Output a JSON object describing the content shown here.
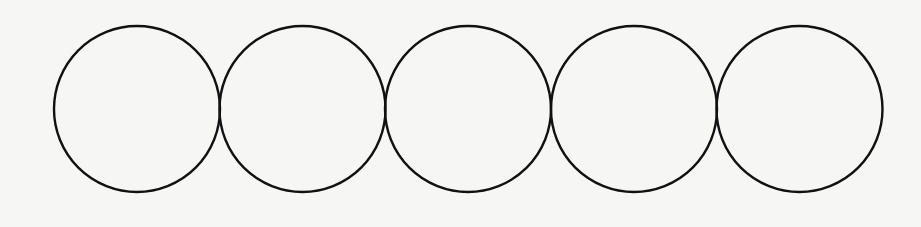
{
  "diagram": {
    "title": "Five tangent circles in a row",
    "background": "#f6f6f5",
    "stroke": "#111111",
    "stroke_width": 2.4,
    "circles": [
      {
        "cx": 137,
        "cy": 109,
        "r": 83
      },
      {
        "cx": 302.5,
        "cy": 109,
        "r": 83
      },
      {
        "cx": 468,
        "cy": 109,
        "r": 83
      },
      {
        "cx": 634,
        "cy": 109,
        "r": 83
      },
      {
        "cx": 799.5,
        "cy": 109,
        "r": 83
      }
    ]
  }
}
